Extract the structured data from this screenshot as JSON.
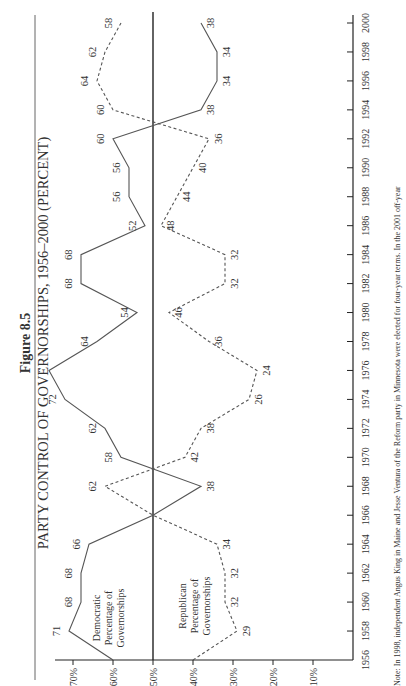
{
  "chart_data": {
    "type": "line",
    "figure_label": "Figure 8.5",
    "title": "PARTY CONTROL OF GOVERNORSHIPS, 1956–2000 (PERCENT)",
    "orientation": "rotated-90-ccw",
    "xlabel": "",
    "ylabel": "",
    "x": [
      1956,
      1958,
      1960,
      1962,
      1964,
      1966,
      1968,
      1970,
      1972,
      1974,
      1976,
      1978,
      1980,
      1982,
      1984,
      1986,
      1988,
      1990,
      1992,
      1994,
      1996,
      1998,
      2000
    ],
    "xlim": [
      1956,
      2000
    ],
    "ylim": [
      0,
      75
    ],
    "y_ticks": [
      {
        "value": 70,
        "label": "70%"
      },
      {
        "value": 60,
        "label": "60%"
      },
      {
        "value": 50,
        "label": "50%"
      },
      {
        "value": 40,
        "label": "40%"
      },
      {
        "value": 30,
        "label": "30%"
      },
      {
        "value": 20,
        "label": "20%"
      },
      {
        "value": 10,
        "label": "10%"
      }
    ],
    "reference_line": 50,
    "grid": false,
    "series": [
      {
        "name": "Democratic Percentage of Governorships",
        "label_lines": [
          "Democratic",
          "Percentage of",
          "Governorships"
        ],
        "style": "solid",
        "color": "#555555",
        "values": [
          60,
          71,
          68,
          68,
          66,
          50,
          38,
          58,
          62,
          72,
          76,
          64,
          54,
          68,
          68,
          52,
          56,
          56,
          60,
          38,
          34,
          34,
          38
        ],
        "data_labels": [
          "",
          "71",
          "68",
          "68",
          "66",
          "",
          "38",
          "58",
          "62",
          "72",
          "..",
          "64",
          "54",
          "68",
          "68",
          "52",
          "56",
          "56",
          "60",
          "38",
          "34",
          "34",
          "38"
        ]
      },
      {
        "name": "Republican Percentage of Governorships",
        "label_lines": [
          "Republican",
          "Percentage of",
          "Governorships"
        ],
        "style": "dashed",
        "color": "#555555",
        "values": [
          40,
          29,
          32,
          32,
          34,
          50,
          62,
          42,
          38,
          26,
          24,
          36,
          46,
          32,
          32,
          48,
          44,
          40,
          36,
          60,
          64,
          62,
          58
        ],
        "data_labels": [
          "",
          "29",
          "32",
          "32",
          "34",
          "",
          "62",
          "42",
          "38",
          "26",
          "24",
          "36",
          "46",
          "32",
          "32",
          "48",
          "44",
          "40",
          "36",
          "60",
          "64",
          "62",
          "58"
        ]
      }
    ],
    "note": "Note: In 1998, independent Angus King in Maine and Jesse Ventura of the Reform party in Minnesota were elected for four-year terms. In the 2001 off-year"
  }
}
